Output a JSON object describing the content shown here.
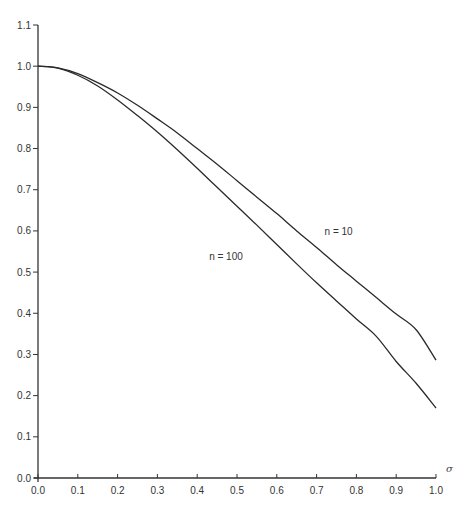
{
  "chart_data": {
    "type": "line",
    "title": "",
    "xlabel": "σ",
    "ylabel": "",
    "xlim": [
      0.0,
      1.0
    ],
    "ylim": [
      0.0,
      1.1
    ],
    "grid": false,
    "legend": "none (inline curve labels)",
    "x_ticks": [
      "0.0",
      "0.1",
      "0.2",
      "0.3",
      "0.4",
      "0.5",
      "0.6",
      "0.7",
      "0.8",
      "0.9",
      "1.0"
    ],
    "y_ticks": [
      "0.0",
      "0.1",
      "0.2",
      "0.3",
      "0.4",
      "0.5",
      "0.6",
      "0.7",
      "0.8",
      "0.9",
      "1.0",
      "1.1"
    ],
    "x": [
      0.0,
      0.05,
      0.1,
      0.15,
      0.2,
      0.25,
      0.3,
      0.35,
      0.4,
      0.45,
      0.5,
      0.55,
      0.6,
      0.65,
      0.7,
      0.75,
      0.8,
      0.85,
      0.9,
      0.95,
      1.0
    ],
    "series": [
      {
        "name": "n = 10",
        "values": [
          1.0,
          0.996,
          0.982,
          0.96,
          0.935,
          0.905,
          0.872,
          0.838,
          0.8,
          0.762,
          0.722,
          0.682,
          0.642,
          0.6,
          0.56,
          0.518,
          0.478,
          0.438,
          0.398,
          0.36,
          0.286
        ]
      },
      {
        "name": "n = 100",
        "values": [
          1.0,
          0.995,
          0.978,
          0.952,
          0.918,
          0.88,
          0.84,
          0.797,
          0.752,
          0.706,
          0.66,
          0.614,
          0.567,
          0.52,
          0.474,
          0.43,
          0.386,
          0.344,
          0.283,
          0.23,
          0.17
        ]
      }
    ],
    "annotations": [
      {
        "text": "n = 10",
        "x": 0.72,
        "y": 0.59
      },
      {
        "text": "n = 100",
        "x": 0.43,
        "y": 0.53
      }
    ]
  }
}
